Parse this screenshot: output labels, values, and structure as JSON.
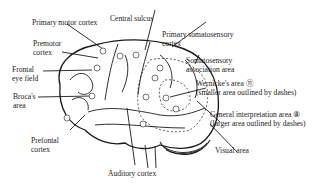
{
  "labels": {
    "primary_motor": "Primary motor cortex",
    "central_sulcus": "Central sulcus",
    "primary_somato_1": "Primary somatosensory",
    "primary_somato_2": "cortex",
    "premotor_1": "Premotor",
    "premotor_2": "cortex",
    "somato_assoc_1": "Somatosensory",
    "somato_assoc_2": "association area",
    "frontal_eye_1": "Frontal",
    "frontal_eye_2": "eye field",
    "wernicke_1": "Wernicke's area ⑪",
    "wernicke_2": "(smaller area outlined by dashes)",
    "broca_1": "Broca's",
    "broca_2": "area",
    "general_interp_1": "General interpretation area ⑧",
    "general_interp_2": "(larger area outlined by dashes)",
    "prefrontal_1": "Prefontal",
    "prefrontal_2": "cortex",
    "visual": "Visual area",
    "auditory": "Auditory cortex"
  },
  "markers": [
    "1",
    "2",
    "3",
    "4",
    "5",
    "6",
    "7",
    "8",
    "9",
    "10",
    "11",
    "12"
  ]
}
